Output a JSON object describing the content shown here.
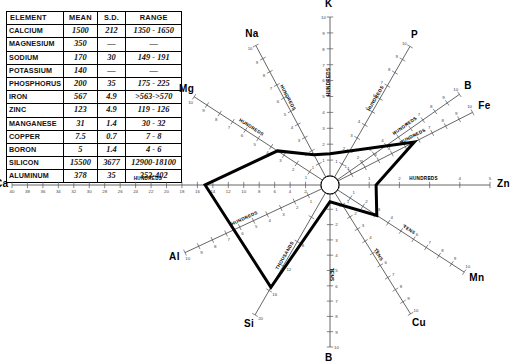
{
  "table": {
    "headers": [
      "ELEMENT",
      "MEAN",
      "S.D.",
      "RANGE"
    ],
    "rows": [
      {
        "element": "CALCIUM",
        "mean": "1500",
        "sd": "212",
        "range": "1350 - 1650"
      },
      {
        "element": "MAGNESIUM",
        "mean": "350",
        "sd": "—",
        "range": "—"
      },
      {
        "element": "SODIUM",
        "mean": "170",
        "sd": "30",
        "range": "149 - 191"
      },
      {
        "element": "POTASSIUM",
        "mean": "140",
        "sd": "—",
        "range": "—"
      },
      {
        "element": "PHOSPHORUS",
        "mean": "200",
        "sd": "35",
        "range": "175 - 225"
      },
      {
        "element": "IRON",
        "mean": "567",
        "sd": "4.9",
        "range": ">563->570"
      },
      {
        "element": "ZINC",
        "mean": "123",
        "sd": "4.9",
        "range": "119 - 126"
      },
      {
        "element": "MANGANESE",
        "mean": "31",
        "sd": "1.4",
        "range": "30 - 32"
      },
      {
        "element": "COPPER",
        "mean": "7.5",
        "sd": "0.7",
        "range": "7 - 8"
      },
      {
        "element": "BORON",
        "mean": "5",
        "sd": "1.4",
        "range": "4 - 6"
      },
      {
        "element": "SILICON",
        "mean": "15500",
        "sd": "3677",
        "range": "12900-18100"
      },
      {
        "element": "ALUMINUM",
        "mean": "378",
        "sd": "35",
        "range": "353-402"
      }
    ]
  },
  "chart_data": {
    "type": "radar",
    "title": "",
    "center": {
      "x": 330,
      "y": 185
    },
    "hub_radius": 9,
    "grid": false,
    "legend": "none",
    "axis_unit_labels": {
      "hundreds": "HUNDREDS",
      "tens": "TENS",
      "thousands": "THOUSANDS"
    },
    "axes": [
      {
        "element": "K",
        "label": "K",
        "angle_deg": 90,
        "unit": "HUNDREDS",
        "max": 10,
        "ticks": [
          0,
          1,
          2,
          3,
          4,
          5,
          6,
          7,
          8,
          9,
          10
        ],
        "value": 1.4,
        "length": 168
      },
      {
        "element": "P",
        "label": "P",
        "angle_deg": 60,
        "unit": "HUNDREDS",
        "max": 10,
        "ticks": [
          0,
          1,
          2,
          3,
          4,
          5,
          6,
          7,
          8,
          9,
          10
        ],
        "value": 2.0,
        "length": 160
      },
      {
        "element": "B",
        "label": "B",
        "angle_deg": 35,
        "unit": "HUNDREDS",
        "max": 10,
        "ticks": [
          0,
          1,
          2,
          3,
          4,
          5,
          6,
          7,
          8,
          9,
          10
        ],
        "value": 0.05,
        "length": 158
      },
      {
        "element": "Fe",
        "label": "Fe",
        "angle_deg": 27,
        "unit": "HUNDREDS",
        "max": 10,
        "ticks": [
          0,
          1,
          2,
          3,
          4,
          5,
          6,
          7,
          8,
          9,
          10
        ],
        "value": 5.67,
        "length": 160
      },
      {
        "element": "Zn",
        "label": "Zn",
        "angle_deg": 0,
        "unit": "HUNDREDS",
        "max": 5,
        "ticks": [
          0,
          1,
          2,
          3,
          4,
          5
        ],
        "value": 1.23,
        "length": 160
      },
      {
        "element": "Mn",
        "label": "Mn",
        "angle_deg": -33,
        "unit": "TENS",
        "max": 10,
        "ticks": [
          0,
          1,
          2,
          3,
          4,
          5,
          6,
          7,
          8,
          9,
          10
        ],
        "value": 3.1,
        "length": 160
      },
      {
        "element": "Cu",
        "label": "Cu",
        "angle_deg": -58,
        "unit": "TENS",
        "max": 10,
        "ticks": [
          0,
          1,
          2,
          3,
          4,
          5,
          6,
          7,
          8,
          9,
          10
        ],
        "value": 0.75,
        "length": 152
      },
      {
        "element": "B2",
        "label": "B",
        "angle_deg": -90,
        "unit": "TENS",
        "max": 10,
        "ticks": [
          0,
          1,
          2,
          3,
          4,
          5,
          6,
          7,
          8,
          9,
          10
        ],
        "value": 0.5,
        "length": 162
      },
      {
        "element": "Si",
        "label": "Si",
        "angle_deg": -120,
        "unit": "THOUSANDS",
        "max": 20,
        "ticks": [
          0,
          4,
          8,
          12,
          16,
          20
        ],
        "value": 15.5,
        "length": 150
      },
      {
        "element": "Al",
        "label": "Al",
        "angle_deg": -155,
        "unit": "HUNDREDS",
        "max": 10,
        "ticks": [
          0,
          1,
          2,
          3,
          4,
          5,
          6,
          7,
          8,
          9,
          10
        ],
        "value": 3.78,
        "length": 160
      },
      {
        "element": "Ca",
        "label": "Ca",
        "angle_deg": 180,
        "unit": "HUNDREDS",
        "max": 40,
        "ticks": [
          0,
          2,
          4,
          6,
          8,
          10,
          12,
          14,
          16,
          18,
          20,
          22,
          24,
          26,
          28,
          30,
          32,
          34,
          36,
          38,
          40
        ],
        "value": 15.0,
        "length": 318
      },
      {
        "element": "Mg",
        "label": "Mg",
        "angle_deg": 147,
        "unit": "HUNDREDS",
        "max": 10,
        "ticks": [
          0,
          1,
          2,
          3,
          4,
          5,
          6,
          7,
          8,
          9,
          10
        ],
        "value": 3.5,
        "length": 162
      },
      {
        "element": "Na",
        "label": "Na",
        "angle_deg": 118,
        "unit": "HUNDREDS",
        "max": 10,
        "ticks": [
          0,
          1,
          2,
          3,
          4,
          5,
          6,
          7,
          8,
          9,
          10
        ],
        "value": 1.7,
        "length": 158
      }
    ],
    "trace": {
      "color": "#000000",
      "width": 3,
      "closed": true,
      "points_order": [
        "K",
        "P",
        "Fe",
        "Zn",
        "Mn",
        "B2",
        "Si",
        "Ca",
        "Mg",
        "Na"
      ]
    }
  }
}
